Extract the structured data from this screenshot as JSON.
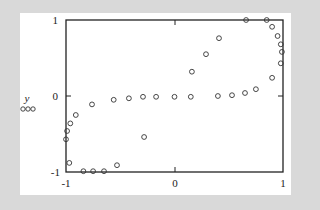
{
  "chart_data": {
    "type": "scatter",
    "title": "",
    "xlabel": "x",
    "ylabel": "y",
    "xlim": [
      -1,
      1
    ],
    "ylim": [
      -1,
      1
    ],
    "grid": false,
    "legend": {
      "entries": [
        "ooo"
      ],
      "position": "left, beside y label"
    },
    "x_ticks": [
      -1,
      0,
      1
    ],
    "y_ticks": [
      -1,
      0,
      1
    ],
    "x_tick_labels": [
      "-1",
      "0",
      "1"
    ],
    "y_tick_labels": [
      "-1",
      "0",
      "1"
    ],
    "marker": "open circle",
    "series": [
      {
        "name": "ooo",
        "points": [
          [
            -0.91,
            -0.25
          ],
          [
            -0.96,
            -0.36
          ],
          [
            -0.99,
            -0.46
          ],
          [
            -1.0,
            -0.57
          ],
          [
            -0.97,
            -0.88
          ],
          [
            -0.84,
            -0.99
          ],
          [
            -0.75,
            -0.99
          ],
          [
            -0.65,
            -0.99
          ],
          [
            -0.53,
            -0.91
          ],
          [
            -0.76,
            -0.11
          ],
          [
            -0.56,
            -0.05
          ],
          [
            -0.42,
            -0.03
          ],
          [
            -0.29,
            -0.01
          ],
          [
            -0.17,
            -0.01
          ],
          [
            -0.28,
            -0.54
          ],
          [
            0.0,
            -0.01
          ],
          [
            0.15,
            -0.01
          ],
          [
            0.16,
            0.32
          ],
          [
            0.29,
            0.55
          ],
          [
            0.41,
            0.76
          ],
          [
            0.4,
            0.0
          ],
          [
            0.53,
            0.01
          ],
          [
            0.65,
            0.04
          ],
          [
            0.75,
            0.09
          ],
          [
            0.9,
            0.24
          ],
          [
            0.66,
            1.0
          ],
          [
            0.85,
            1.0
          ],
          [
            0.9,
            0.91
          ],
          [
            0.95,
            0.79
          ],
          [
            0.98,
            0.68
          ],
          [
            0.99,
            0.58
          ],
          [
            0.98,
            0.43
          ]
        ]
      }
    ]
  },
  "labels": {
    "x_axis": "x",
    "y_axis": "y",
    "legend_marker": "ooo",
    "x_min": "-1",
    "x_mid": "0",
    "x_max": "1",
    "y_min": "-1",
    "y_mid": "0",
    "y_max": "1"
  },
  "colors": {
    "background": "#d9d9d9",
    "panel": "#ffffff",
    "ink": "#222222"
  }
}
